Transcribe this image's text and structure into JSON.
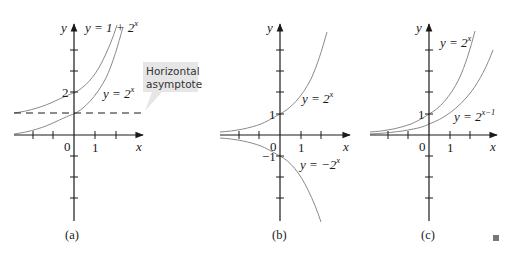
{
  "figure": {
    "colors": {
      "axis": "#1a1a1a",
      "curve": "#8a8a8a",
      "callout_bg": "#e6e6e6",
      "end_mark": "#777777"
    },
    "end_mark": "square",
    "panels": [
      {
        "id": "a",
        "caption": "(a)",
        "axis_labels": {
          "x": "x",
          "y": "y"
        },
        "tick_labels": {
          "origin": "0",
          "x1": "1",
          "y2": "2"
        },
        "curves": [
          {
            "label_base": "y = 1 + 2",
            "label_sup": "x",
            "formula": "1 + 2^x"
          },
          {
            "label_base": "y = 2",
            "label_sup": "x",
            "formula": "2^x"
          }
        ],
        "asymptote": {
          "y": 1,
          "style": "dashed"
        },
        "callout": {
          "line1": "Horizontal",
          "line2": "asymptote"
        }
      },
      {
        "id": "b",
        "caption": "(b)",
        "axis_labels": {
          "x": "x",
          "y": "y"
        },
        "tick_labels": {
          "origin": "0",
          "x1": "1",
          "y1": "1",
          "yneg1": "−1"
        },
        "curves": [
          {
            "label_base": "y = 2",
            "label_sup": "x",
            "formula": "2^x"
          },
          {
            "label_base": "y = −2",
            "label_sup": "x",
            "formula": "-2^x"
          }
        ]
      },
      {
        "id": "c",
        "caption": "(c)",
        "axis_labels": {
          "x": "x",
          "y": "y"
        },
        "tick_labels": {
          "origin": "0",
          "x1": "1",
          "y1": "1"
        },
        "curves": [
          {
            "label_base": "y = 2",
            "label_sup": "x",
            "formula": "2^x"
          },
          {
            "label_base": "y = 2",
            "label_sup": "x−1",
            "formula": "2^(x-1)"
          }
        ]
      }
    ]
  }
}
